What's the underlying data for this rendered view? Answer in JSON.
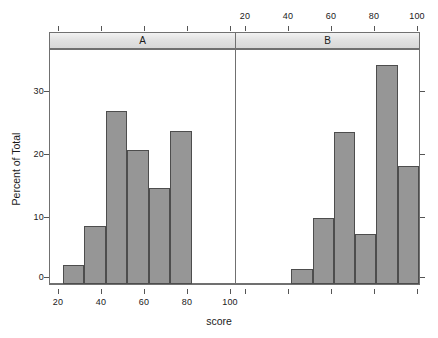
{
  "chart_data": {
    "type": "bar",
    "title": "",
    "subtitle": "",
    "xlabel": "score",
    "ylabel": "Percent of Total",
    "xlim": [
      14,
      100
    ],
    "ylim": [
      0,
      37
    ],
    "grid": false,
    "legend_position": "none",
    "layout": "trellis-two-panel-histogram",
    "bin_width": 10,
    "x_ticks": [
      20,
      40,
      60,
      80,
      100
    ],
    "x_tick_labels": [
      "20",
      "40",
      "60",
      "80",
      "100"
    ],
    "y_ticks": [
      0,
      10,
      20,
      30
    ],
    "y_tick_labels": [
      "0",
      "10",
      "20",
      "30"
    ],
    "panels": [
      {
        "label": "A",
        "bin_starts": [
          20,
          30,
          40,
          50,
          60,
          70
        ],
        "bin_ends": [
          30,
          40,
          50,
          60,
          70,
          80
        ],
        "values": [
          3.0,
          9.1,
          27.3,
          21.2,
          15.2,
          24.2
        ],
        "x_axis_labels_visible": "bottom"
      },
      {
        "label": "B",
        "bin_starts": [
          40,
          50,
          60,
          70,
          80,
          90
        ],
        "bin_ends": [
          50,
          60,
          70,
          80,
          90,
          100
        ],
        "values": [
          2.4,
          10.5,
          24.0,
          7.9,
          34.6,
          18.6
        ],
        "x_axis_labels_visible": "top"
      }
    ]
  },
  "axes": {
    "y_title": "Percent of Total",
    "x_title": "score",
    "y_tick_labels": [
      "30",
      "20",
      "10",
      "0"
    ],
    "x_tick_labels_bottom": [
      "20",
      "40",
      "60",
      "80",
      "100"
    ],
    "x_tick_labels_top": [
      "20",
      "40",
      "60",
      "80",
      "100"
    ]
  },
  "strips": {
    "panel_a_label": "A",
    "panel_b_label": "B"
  },
  "colors": {
    "bar_fill": "#969696",
    "bar_border": "#4d4d4d",
    "strip_fill": "#e2e2e2",
    "frame": "#707070",
    "text": "#1a1a1a",
    "background": "#ffffff"
  }
}
